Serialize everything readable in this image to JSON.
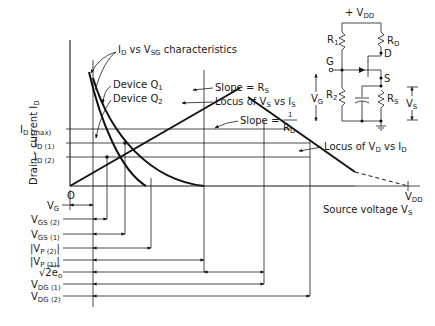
{
  "figure": {
    "type": "JFET self-bias design diagram",
    "y_axis_label": "Drain - current I",
    "y_axis_label_sub": "D",
    "x_axis_label": "Source voltage V",
    "x_axis_label_sub": "S",
    "origin_label": "O",
    "x_end_label": "V",
    "x_end_label_sub": "DD"
  },
  "y_ticks": [
    {
      "main": "I",
      "sub": "D (max)"
    },
    {
      "main": "I",
      "sub": "D (1)"
    },
    {
      "main": "I",
      "sub": "D (2)"
    }
  ],
  "annotations": {
    "characteristics": {
      "a": "I",
      "a_sub": "D",
      "b": " vs V",
      "b_sub": "SG",
      "c": " characteristics"
    },
    "device_q1": {
      "main": "Device Q",
      "sub": "1"
    },
    "device_q2": {
      "main": "Device Q",
      "sub": "2"
    },
    "slope_rs": {
      "main": "Slope = R",
      "sub": "S"
    },
    "locus_vs_is": {
      "a": "Locus of V",
      "a_sub": "S",
      "b": " vs I",
      "b_sub": "S"
    },
    "slope_rd": {
      "main": "Slope = ",
      "num": "1",
      "den": "R",
      "den_sub": "D"
    },
    "locus_vd_id": {
      "a": "Locus of V",
      "a_sub": "D",
      "b": " vs I",
      "b_sub": "D"
    }
  },
  "dimension_labels": [
    {
      "main": "V",
      "sub": "G"
    },
    {
      "main": "V",
      "sub": "GS (2)"
    },
    {
      "main": "V",
      "sub": "GS (1)"
    },
    {
      "main": "|V",
      "sub": "P (2)",
      "tail": "|"
    },
    {
      "main": "|V",
      "sub": "P (1)",
      "tail": "|"
    },
    {
      "main": "√2e",
      "sub": "o"
    },
    {
      "main": "V",
      "sub": "DG (1)"
    },
    {
      "main": "V",
      "sub": "DG (2)"
    }
  ],
  "circuit": {
    "supply": {
      "main": "+ V",
      "sub": "DD"
    },
    "r1": {
      "main": "R",
      "sub": "1"
    },
    "r2": {
      "main": "R",
      "sub": "2"
    },
    "rd": {
      "main": "R",
      "sub": "D"
    },
    "rs": {
      "main": "R",
      "sub": "S"
    },
    "gate": "G",
    "drain": "D",
    "source": "S",
    "vg": {
      "main": "V",
      "sub": "G"
    },
    "vs": {
      "main": "V",
      "sub": "S"
    }
  }
}
